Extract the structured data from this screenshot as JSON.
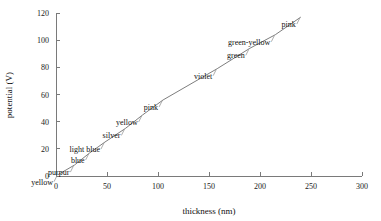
{
  "chart_data": {
    "type": "scatter",
    "title": "",
    "xlabel": "thickness (nm)",
    "ylabel": "potential (V)",
    "xlim": [
      0,
      300
    ],
    "ylim": [
      0,
      120
    ],
    "xticks": [
      "0",
      "50",
      "100",
      "150",
      "200",
      "250",
      "300"
    ],
    "yticks": [
      "0",
      "20",
      "40",
      "60",
      "80",
      "100",
      "120"
    ],
    "grid": false,
    "legend": "none",
    "connected": true,
    "series": [
      {
        "name": "anodization series",
        "points": [
          {
            "label": "yellow",
            "x": 2,
            "y": 1
          },
          {
            "label": "purpur",
            "x": 18,
            "y": 8
          },
          {
            "label": "blue",
            "x": 33,
            "y": 17
          },
          {
            "label": "light blue",
            "x": 48,
            "y": 25
          },
          {
            "label": "silver",
            "x": 68,
            "y": 35
          },
          {
            "label": "yellow",
            "x": 85,
            "y": 45
          },
          {
            "label": "pink",
            "x": 105,
            "y": 56
          },
          {
            "label": "violet",
            "x": 158,
            "y": 79
          },
          {
            "label": "green",
            "x": 190,
            "y": 94
          },
          {
            "label": "green-yellow",
            "x": 215,
            "y": 104
          },
          {
            "label": "pink",
            "x": 240,
            "y": 117
          }
        ]
      }
    ],
    "colors": {
      "axis": "#7a7a7a",
      "line": "#6e6e6e",
      "text": "#111111",
      "background": "#ffffff"
    }
  }
}
